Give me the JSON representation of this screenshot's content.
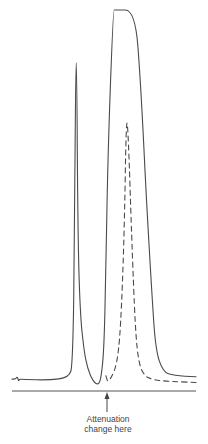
{
  "chart_data": {
    "type": "line",
    "title": "",
    "xlabel": "",
    "ylabel": "",
    "grid": false,
    "legend": "none",
    "xlim": [
      0,
      100
    ],
    "ylim": [
      0,
      100
    ],
    "series": [
      {
        "name": "trace",
        "style": "solid",
        "x": [
          0,
          2,
          3,
          3.5,
          4,
          6,
          20,
          31,
          33,
          34,
          34.6,
          35.2,
          35.8,
          37,
          39,
          41,
          44,
          47,
          48.5,
          50,
          51,
          52,
          55,
          56,
          67,
          70,
          73,
          76,
          78,
          82,
          88,
          100
        ],
        "y": [
          2.1,
          2.1,
          2.8,
          1.5,
          2.1,
          2.0,
          1.8,
          2.5,
          6,
          40,
          86,
          86,
          40,
          20,
          10,
          5,
          1.5,
          0.5,
          2.5,
          10,
          30,
          60,
          100,
          100,
          100,
          80,
          50,
          25,
          10,
          4,
          3,
          2.7
        ]
      },
      {
        "name": "attenuated",
        "style": "dashed",
        "x": [
          51,
          52,
          54,
          57,
          59,
          61,
          62,
          63,
          65,
          67,
          69,
          72,
          76,
          82,
          90,
          100
        ],
        "y": [
          3,
          1.3,
          2.5,
          6,
          15,
          40,
          70,
          70,
          40,
          15,
          6,
          3,
          2,
          1.6,
          1.4,
          1.2
        ]
      }
    ],
    "peaks": [
      {
        "label": "peak-1",
        "apex_x": 35.2,
        "apex_y": 86
      },
      {
        "label": "peak-2",
        "apex_x": 61.5,
        "apex_y": 100,
        "off_scale": true
      },
      {
        "label": "peak-2-attenuated",
        "apex_x": 62.5,
        "apex_y": 70
      }
    ],
    "annotations": [
      {
        "text_line1": "Attenuation",
        "text_line2": "change here",
        "x": 52,
        "arrow": "up"
      }
    ]
  },
  "annotation": {
    "line1": "Attenuation",
    "line2": "change here"
  }
}
